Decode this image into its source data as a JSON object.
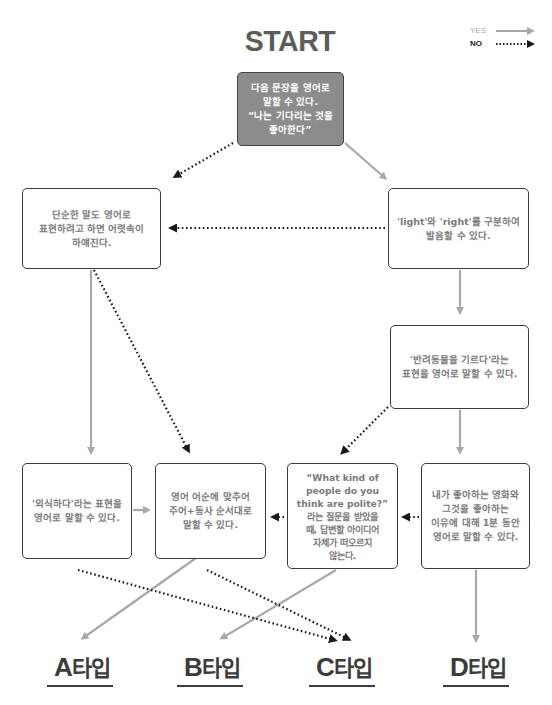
{
  "header": {
    "cut_text": "",
    "title": "START"
  },
  "legend": {
    "yes_label": "YES",
    "no_label": "NO",
    "yes_color": "#a8a8a8",
    "no_color": "#222222"
  },
  "nodes": {
    "start": "다음 문장을 영어로\n말할 수 있다.\n“나는 기다리는 것을\n좋아한다”",
    "simple_words": "단순한 말도 영어로\n표현하려고 하면 어렷속이\n하얘진다.",
    "light_right": "'light'와 'right'를 구분하여\n발음할 수 있다.",
    "pet": "'반려동물을 기르다'라는\n표현을 영어로 말할 수 있다.",
    "eat_out": "'외식하다'라는 표현을\n영어로 말할 수 있다.",
    "word_order": "영어 어순에 맞추어\n주어+동사 순서대로\n말할 수 있다.",
    "polite": "“What kind of\npeople do you\nthink are polite?”\n라는 질문을 받았을\n때, 답변할 아이디어\n자체가 떠오르지\n않는다.",
    "movie": "내가 좋아하는 영화와\n그것을 좋아하는\n이유에 대해 1분 동안\n영어로 말할 수 있다."
  },
  "results": [
    {
      "letter": "A",
      "suffix": "타입"
    },
    {
      "letter": "B",
      "suffix": "타입"
    },
    {
      "letter": "C",
      "suffix": "타입"
    },
    {
      "letter": "D",
      "suffix": "타입"
    }
  ],
  "colors": {
    "start_fill": "#8c8c8c",
    "box_border": "#3a3a3a",
    "box_text": "#7a7a7a",
    "yes_arrow": "#a8a8a8",
    "no_arrow": "#1a1a1a",
    "title": "#5c5c5c"
  }
}
